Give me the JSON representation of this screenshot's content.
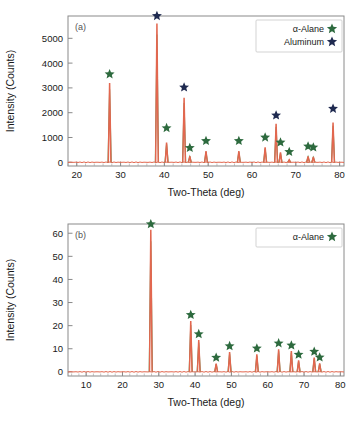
{
  "colors": {
    "alane_star": "#2d6a3e",
    "aluminum_star": "#1f2a50",
    "peak_red": "#e2674f",
    "peak_green": "#4f9e5e",
    "axis": "#8a8a8a"
  },
  "panel_a": {
    "tag": "(a)",
    "legend": [
      {
        "label": "α-Alane",
        "marker": "star-icon",
        "color": "#2d6a3e"
      },
      {
        "label": "Aluminum",
        "marker": "star-icon",
        "color": "#1f2a50"
      }
    ]
  },
  "panel_b": {
    "tag": "(b)",
    "legend": [
      {
        "label": "α-Alane",
        "marker": "star-icon",
        "color": "#2d6a3e"
      }
    ]
  },
  "chart_data": [
    {
      "type": "line",
      "panel": "(a)",
      "title": "",
      "xlabel": "Two-Theta (deg)",
      "ylabel": "Intensity (Counts)",
      "xlim": [
        18,
        81
      ],
      "ylim": [
        -150,
        5900
      ],
      "xticks": [
        20,
        30,
        40,
        50,
        60,
        70,
        80
      ],
      "yticks": [
        0,
        1000,
        2000,
        3000,
        4000,
        5000
      ],
      "grid": false,
      "legend_position": "top-right",
      "series": [
        {
          "name": "XRD pattern",
          "x": [
            27.5,
            38.3,
            40.5,
            44.5,
            45.8,
            49.5,
            57.0,
            63.0,
            65.5,
            66.5,
            68.5,
            72.8,
            74.0,
            78.5
          ],
          "values": [
            3200,
            5600,
            800,
            2600,
            250,
            450,
            450,
            600,
            1550,
            400,
            100,
            240,
            220,
            1600
          ]
        }
      ],
      "markers": [
        {
          "x": 27.5,
          "y": 3350,
          "phase": "α-Alane",
          "color": "#2d6a3e"
        },
        {
          "x": 38.3,
          "y": 5700,
          "phase": "Aluminum",
          "color": "#1f2a50"
        },
        {
          "x": 40.5,
          "y": 1180,
          "phase": "α-Alane",
          "color": "#2d6a3e"
        },
        {
          "x": 44.5,
          "y": 2820,
          "phase": "Aluminum",
          "color": "#1f2a50"
        },
        {
          "x": 45.8,
          "y": 380,
          "phase": "α-Alane",
          "color": "#2d6a3e"
        },
        {
          "x": 49.5,
          "y": 660,
          "phase": "α-Alane",
          "color": "#2d6a3e"
        },
        {
          "x": 57.0,
          "y": 660,
          "phase": "α-Alane",
          "color": "#2d6a3e"
        },
        {
          "x": 63.0,
          "y": 800,
          "phase": "α-Alane",
          "color": "#2d6a3e"
        },
        {
          "x": 65.5,
          "y": 1690,
          "phase": "Aluminum",
          "color": "#1f2a50"
        },
        {
          "x": 66.5,
          "y": 600,
          "phase": "α-Alane",
          "color": "#2d6a3e"
        },
        {
          "x": 68.5,
          "y": 220,
          "phase": "α-Alane",
          "color": "#2d6a3e"
        },
        {
          "x": 72.8,
          "y": 440,
          "phase": "α-Alane",
          "color": "#2d6a3e"
        },
        {
          "x": 74.0,
          "y": 400,
          "phase": "α-Alane",
          "color": "#2d6a3e"
        },
        {
          "x": 78.5,
          "y": 1960,
          "phase": "Aluminum",
          "color": "#1f2a50"
        }
      ]
    },
    {
      "type": "line",
      "panel": "(b)",
      "title": "",
      "xlabel": "Two-Theta (deg)",
      "ylabel": "Intensity (Counts)",
      "xlim": [
        5,
        81
      ],
      "ylim": [
        -1.8,
        64
      ],
      "xticks": [
        10,
        20,
        30,
        40,
        50,
        60,
        70,
        80
      ],
      "yticks": [
        0,
        10,
        20,
        30,
        40,
        50,
        60
      ],
      "grid": false,
      "legend_position": "top-right",
      "series": [
        {
          "name": "XRD pattern",
          "x": [
            27.8,
            38.8,
            41.0,
            45.8,
            49.5,
            57.0,
            63.0,
            66.5,
            68.5,
            72.8,
            74.3
          ],
          "values": [
            61.5,
            22.0,
            13.8,
            3.6,
            8.6,
            7.6,
            9.8,
            9.0,
            5.0,
            6.2,
            3.7
          ]
        }
      ],
      "markers": [
        {
          "x": 27.8,
          "y": 61.8,
          "phase": "α-Alane",
          "color": "#2d6a3e"
        },
        {
          "x": 38.8,
          "y": 22.5,
          "phase": "α-Alane",
          "color": "#2d6a3e"
        },
        {
          "x": 41.0,
          "y": 14.2,
          "phase": "α-Alane",
          "color": "#2d6a3e"
        },
        {
          "x": 45.8,
          "y": 4.0,
          "phase": "α-Alane",
          "color": "#2d6a3e"
        },
        {
          "x": 49.5,
          "y": 9.0,
          "phase": "α-Alane",
          "color": "#2d6a3e"
        },
        {
          "x": 57.0,
          "y": 8.0,
          "phase": "α-Alane",
          "color": "#2d6a3e"
        },
        {
          "x": 63.0,
          "y": 10.2,
          "phase": "α-Alane",
          "color": "#2d6a3e"
        },
        {
          "x": 66.5,
          "y": 9.3,
          "phase": "α-Alane",
          "color": "#2d6a3e"
        },
        {
          "x": 68.5,
          "y": 5.3,
          "phase": "α-Alane",
          "color": "#2d6a3e"
        },
        {
          "x": 72.8,
          "y": 6.6,
          "phase": "α-Alane",
          "color": "#2d6a3e"
        },
        {
          "x": 74.3,
          "y": 4.1,
          "phase": "α-Alane",
          "color": "#2d6a3e"
        }
      ]
    }
  ]
}
